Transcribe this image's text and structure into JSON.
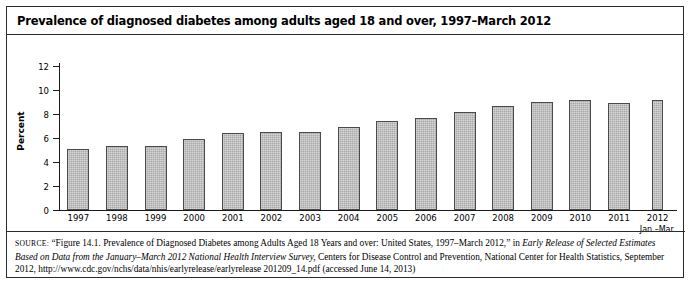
{
  "figure": {
    "title": "Prevalence of diagnosed diabetes among adults aged 18 and over, 1997–March 2012"
  },
  "source": {
    "label": "SOURCE:",
    "part1": " “Figure 14.1. Prevalence of Diagnosed Diabetes among Adults Aged 18 Years and over: United States, 1997–March 2012,” in ",
    "italic1": "Early Release of Selected Estimates Based on Data from the January–March 2012 National Health Interview Survey,",
    "part2": " Centers for Disease Control and Prevention, National Center for Health Statistics, September 2012, http://www.cdc.gov/nchs/data/nhis/earlyrelease/earlyrelease 201209_14.pdf (accessed June 14, 2013)"
  },
  "chart_data": {
    "type": "bar",
    "title": "Prevalence of diagnosed diabetes among adults aged 18 and over, 1997–March 2012",
    "xlabel": "",
    "ylabel": "Percent",
    "ylim": [
      0,
      12
    ],
    "yticks": [
      0,
      2,
      4,
      6,
      8,
      10,
      12
    ],
    "grid": false,
    "legend": null,
    "bar_color": "#a9a9a9",
    "bar_edge_color": "#4a4a4a",
    "categories": [
      "1997",
      "1998",
      "1999",
      "2000",
      "2001",
      "2002",
      "2003",
      "2004",
      "2005",
      "2006",
      "2007",
      "2008",
      "2009",
      "2010",
      "2011",
      "2012"
    ],
    "category_sublabels": [
      "",
      "",
      "",
      "",
      "",
      "",
      "",
      "",
      "",
      "",
      "",
      "",
      "",
      "",
      "",
      "Jan.–Mar."
    ],
    "values": [
      5.1,
      5.3,
      5.3,
      5.9,
      6.4,
      6.5,
      6.5,
      6.9,
      7.4,
      7.7,
      8.2,
      8.7,
      9.0,
      9.2,
      8.9,
      9.2
    ],
    "series": [
      {
        "name": "Percent of adults aged 18 and over with diagnosed diabetes",
        "values": [
          5.1,
          5.3,
          5.3,
          5.9,
          6.4,
          6.5,
          6.5,
          6.9,
          7.4,
          7.7,
          8.2,
          8.7,
          9.0,
          9.2,
          8.9,
          9.2
        ]
      }
    ]
  }
}
